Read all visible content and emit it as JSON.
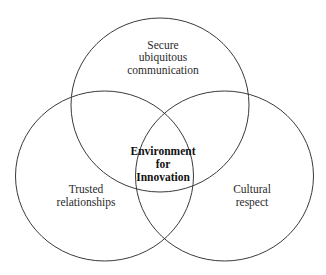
{
  "diagram": {
    "type": "venn",
    "sets": [
      {
        "id": "top",
        "lines": [
          "Secure",
          "ubiquitous",
          "communication"
        ]
      },
      {
        "id": "left",
        "lines": [
          "Trusted",
          "relationships"
        ]
      },
      {
        "id": "right",
        "lines": [
          "Cultural",
          "respect"
        ]
      }
    ],
    "intersection": {
      "lines": [
        "Environment",
        "for",
        "Innovation"
      ]
    },
    "colors": {
      "stroke": "#3a3a3a",
      "text": "#2a2a2a",
      "background": "#ffffff"
    }
  }
}
